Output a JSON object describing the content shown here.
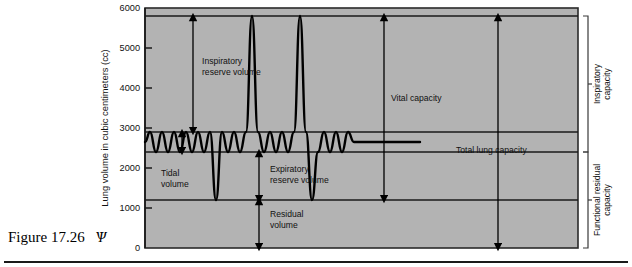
{
  "figure": {
    "caption_label": "Figure 17.26",
    "caption_mark": "Ѱ"
  },
  "chart_data": {
    "type": "line",
    "title": "",
    "xlabel": "",
    "ylabel": "Lung volume in cubic centimeters (cc)",
    "ylim": [
      0,
      6000
    ],
    "yticks": [
      0,
      1000,
      2000,
      3000,
      4000,
      5000,
      6000
    ],
    "ytick_labels": [
      "0",
      "1000",
      "2000",
      "3000",
      "4000",
      "5000",
      "6000"
    ],
    "grid": false,
    "plot_background": "#b3b3b3",
    "trace_color": "#000000",
    "reference_lines": [
      {
        "name": "maximum-inspiration-line",
        "value": 5800
      },
      {
        "name": "end-inspiration-tidal-line",
        "value": 2900
      },
      {
        "name": "end-expiration-tidal-line",
        "value": 2400
      },
      {
        "name": "residual-volume-line",
        "value": 1200
      }
    ],
    "levels": {
      "max_inspiration": 5800,
      "tidal_peak": 2900,
      "tidal_trough": 2400,
      "max_expiration": 1200,
      "baseline": 0
    },
    "series": [
      {
        "name": "spirogram",
        "x": [
          145,
          150,
          156,
          162,
          168,
          174,
          180,
          186,
          192,
          198,
          204,
          210,
          216,
          222,
          228,
          234,
          240,
          246,
          252,
          258,
          264,
          270,
          276,
          282,
          288,
          294,
          300,
          306,
          312,
          318,
          324,
          330,
          336,
          342,
          348,
          354,
          360,
          366,
          372,
          378,
          384,
          390,
          396,
          402,
          408,
          414,
          420
        ],
        "y": [
          2650,
          2900,
          2400,
          2900,
          2400,
          2900,
          2400,
          2900,
          2400,
          2900,
          2400,
          2900,
          1200,
          2900,
          2400,
          2900,
          2400,
          2900,
          5800,
          2900,
          2400,
          2900,
          2400,
          2900,
          2400,
          2900,
          5800,
          2900,
          1200,
          2400,
          2900,
          2400,
          2900,
          2400,
          2900,
          2650,
          2650,
          2650,
          2650,
          2650,
          2650,
          2650,
          2650,
          2650,
          2650,
          2650,
          2650
        ]
      }
    ],
    "annotations": [
      {
        "name": "inspiratory-reserve-volume",
        "label": "Inspiratory\nreserve volume",
        "lines": [
          "Inspiratory",
          "reserve volume"
        ],
        "from": 5800,
        "to": 2900,
        "arrow": "double"
      },
      {
        "name": "tidal-volume",
        "label": "Tidal\nvolume",
        "lines": [
          "Tidal",
          "volume"
        ],
        "from": 2900,
        "to": 2400,
        "arrow": "double"
      },
      {
        "name": "expiratory-reserve-volume",
        "label": "Expiratory\nreserve volume",
        "lines": [
          "Expiratory",
          "reserve volume"
        ],
        "from": 2400,
        "to": 1200,
        "arrow": "double"
      },
      {
        "name": "residual-volume",
        "label": "Residual\nvolume",
        "lines": [
          "Residual",
          "volume"
        ],
        "from": 1200,
        "to": 0,
        "arrow": "double"
      },
      {
        "name": "vital-capacity",
        "label": "Vital capacity",
        "lines": [
          "Vital capacity"
        ],
        "from": 5800,
        "to": 1200,
        "arrow": "double"
      },
      {
        "name": "total-lung-capacity",
        "label": "Total lung capacity",
        "lines": [
          "Total lung capacity"
        ],
        "from": 5800,
        "to": 0,
        "arrow": "double"
      }
    ],
    "brackets": [
      {
        "name": "inspiratory-capacity",
        "label": "Inspiratory capacity",
        "lines": [
          "Inspiratory",
          "capacity"
        ],
        "from": 5800,
        "to": 2400
      },
      {
        "name": "functional-residual-capacity",
        "label": "Functional residual capacity",
        "lines": [
          "Functional residual",
          "capacity"
        ],
        "from": 2400,
        "to": 0
      }
    ]
  }
}
